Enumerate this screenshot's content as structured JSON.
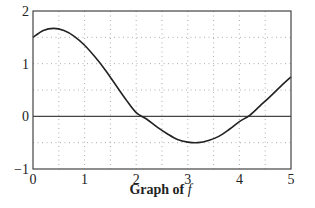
{
  "chart_data": {
    "type": "line",
    "title": "Graph of f",
    "caption_prefix": "Graph of",
    "caption_function": "f",
    "xlabel": "",
    "ylabel": "",
    "xlim": [
      0,
      5
    ],
    "ylim": [
      -1,
      2
    ],
    "x_ticks": [
      "0",
      "1",
      "2",
      "3",
      "4",
      "5"
    ],
    "y_ticks": [
      "2",
      "1",
      "0",
      "−1"
    ],
    "grid": {
      "on": true,
      "style": "dotted",
      "x_step": 0.5,
      "y_step": 0.5
    },
    "reference_lines": [
      {
        "axis": "y",
        "value": 0
      }
    ],
    "series": [
      {
        "name": "f",
        "x": [
          0,
          0.2,
          0.4,
          0.6,
          0.8,
          1.0,
          1.2,
          1.4,
          1.6,
          1.8,
          2.0,
          2.2,
          2.4,
          2.6,
          2.8,
          3.0,
          3.2,
          3.4,
          3.6,
          3.8,
          4.0,
          4.2,
          4.4,
          4.6,
          4.8,
          5.0
        ],
        "y": [
          1.5,
          1.63,
          1.67,
          1.63,
          1.52,
          1.35,
          1.13,
          0.88,
          0.6,
          0.32,
          0.07,
          -0.05,
          -0.2,
          -0.33,
          -0.44,
          -0.49,
          -0.5,
          -0.46,
          -0.38,
          -0.25,
          -0.1,
          0.02,
          0.2,
          0.38,
          0.57,
          0.75
        ]
      }
    ],
    "annotations": {
      "zeros_approx": [
        2.2,
        4.2
      ],
      "max_approx": {
        "x": 0.4,
        "y": 1.67
      },
      "min_approx": {
        "x": 3.15,
        "y": -0.5
      }
    }
  }
}
